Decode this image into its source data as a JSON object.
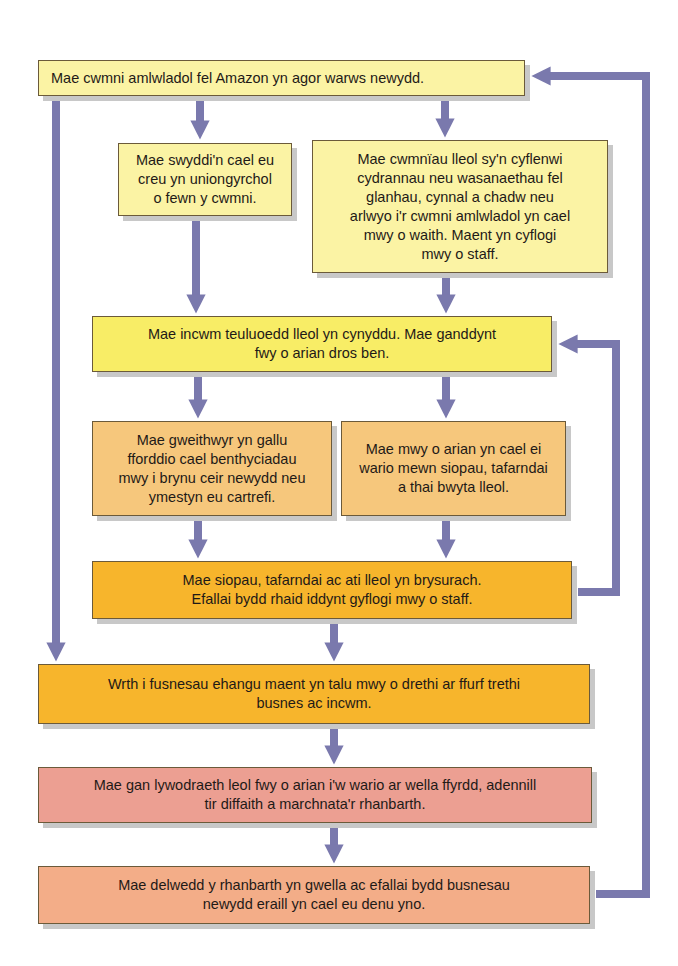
{
  "diagram": {
    "colors": {
      "arrow": "#7a79ad",
      "box_yellow_pale": "#fbf3a4",
      "box_yellow": "#f8ed66",
      "box_orange_pale": "#f6c77c",
      "box_orange": "#f7b52c",
      "box_pink": "#ec9f92",
      "box_peach": "#f3ad88"
    },
    "boxes": [
      {
        "id": "amazon-warehouse",
        "text": "Mae cwmni amlwladol fel Amazon yn agor warws newydd."
      },
      {
        "id": "direct-jobs",
        "text": "Mae swyddi'n cael eu\ncreu yn uniongyrchol\no fewn y cwmni."
      },
      {
        "id": "local-suppliers",
        "text": "Mae cwmnïau lleol sy'n cyflenwi\ncydrannau neu wasanaethau fel\nglanhau, cynnal a chadw neu\narlwyo i'r cwmni amlwladol yn cael\nmwy o waith. Maent yn cyflogi\nmwy o staff."
      },
      {
        "id": "household-income",
        "text": "Mae incwm teuluoedd lleol yn cynyddu. Mae ganddynt\nfwy o arian dros ben."
      },
      {
        "id": "workers-loans",
        "text": "Mae gweithwyr yn gallu\nfforddio cael benthyciadau\nmwy i brynu ceir newydd neu\nymestyn eu cartrefi."
      },
      {
        "id": "local-spending",
        "text": "Mae mwy o arian yn cael ei\nwario mewn siopau, tafarndai\na thai bwyta lleol."
      },
      {
        "id": "shops-busier",
        "text": "Mae siopau, tafarndai ac ati lleol yn brysurach.\nEfallai bydd rhaid iddynt gyflogi mwy o staff."
      },
      {
        "id": "business-taxes",
        "text": "Wrth i fusnesau ehangu maent yn talu mwy o drethi ar ffurf trethi\nbusnes ac incwm."
      },
      {
        "id": "local-government",
        "text": "Mae gan lywodraeth leol fwy o arian i'w wario ar wella ffyrdd, adennill\ntir diffaith a marchnata'r rhanbarth."
      },
      {
        "id": "region-image",
        "text": "Mae delwedd y rhanbarth yn gwella ac efallai bydd busnesau\nnewydd eraill yn cael eu denu yno."
      }
    ]
  }
}
